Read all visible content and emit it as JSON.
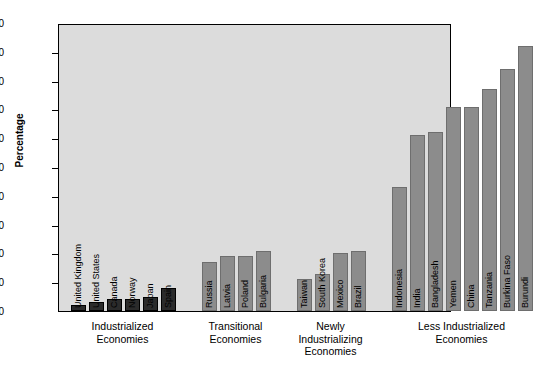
{
  "chart_data": {
    "type": "bar",
    "title": "",
    "subtitle": "",
    "xlabel": "",
    "ylabel": "Percentage",
    "ylim": [
      0,
      100
    ],
    "ytick_labels": [
      "100",
      "90",
      "80",
      "70",
      "60",
      "50",
      "40",
      "30",
      "20",
      "10",
      "0"
    ],
    "yticks": [
      100,
      90,
      80,
      70,
      60,
      50,
      40,
      30,
      20,
      10,
      0
    ],
    "grid": false,
    "legend": "none",
    "plot_background": "#dcdcdc",
    "colors": {
      "industrialized": "#2b2b2b",
      "other_groups": "#8c8c8c"
    },
    "groups": [
      {
        "caption_line1": "Industrialized",
        "caption_line2": "Economies",
        "caption_line3": "",
        "style": "dark",
        "categories": [
          "United Kingdom",
          "United States",
          "Canada",
          "Norway",
          "Japan",
          "Spain"
        ],
        "values": [
          2,
          3,
          4,
          4,
          5,
          8
        ]
      },
      {
        "caption_line1": "Transitional",
        "caption_line2": "Economies",
        "caption_line3": "",
        "style": "mid",
        "categories": [
          "Russia",
          "Latvia",
          "Poland",
          "Bulgaria"
        ],
        "values": [
          17,
          19,
          19,
          21
        ]
      },
      {
        "caption_line1": "Newly",
        "caption_line2": "Industrializing",
        "caption_line3": "Economies",
        "style": "mid",
        "categories": [
          "Taiwan",
          "South Korea",
          "Mexico",
          "Brazil"
        ],
        "values": [
          11,
          13,
          20,
          21
        ]
      },
      {
        "caption_line1": "Less Industrialized",
        "caption_line2": "Economies",
        "caption_line3": "",
        "style": "mid",
        "categories": [
          "Indonesia",
          "India",
          "Bangladesh",
          "Yemen",
          "China",
          "Tanzania",
          "Burkina Faso",
          "Burundi"
        ],
        "values": [
          43,
          61,
          62,
          71,
          71,
          77,
          84,
          92
        ]
      }
    ]
  }
}
